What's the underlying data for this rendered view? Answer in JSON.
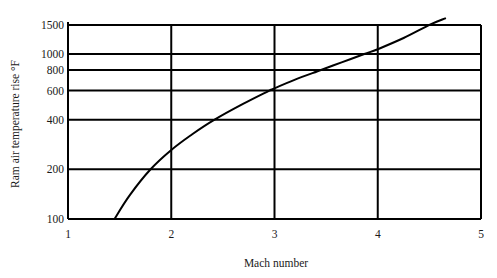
{
  "chart_data": {
    "type": "line",
    "title": "",
    "xlabel": "Mach number",
    "ylabel": "Ram air temperature rise °F",
    "xlim": [
      1,
      5
    ],
    "ylim": [
      100,
      1500
    ],
    "yscale": "log",
    "grid": true,
    "legend": null,
    "x_ticks": [
      "1",
      "2",
      "3",
      "4",
      "5"
    ],
    "y_ticks": [
      "100",
      "200",
      "400",
      "600",
      "800",
      "1000",
      "1500"
    ],
    "series": [
      {
        "name": "Ram air temperature rise",
        "x": [
          1.45,
          1.6,
          1.8,
          2.0,
          2.2,
          2.42,
          2.7,
          2.95,
          3.0,
          3.2,
          3.45,
          3.65,
          3.87,
          4.0,
          4.25,
          4.5,
          4.66
        ],
        "y": [
          100,
          140,
          200,
          262,
          325,
          400,
          500,
          600,
          620,
          700,
          800,
          890,
          1000,
          1070,
          1250,
          1500,
          1650
        ]
      }
    ]
  },
  "plot": {
    "x_pixels": {
      "1": 68,
      "2": 171,
      "3": 276,
      "4": 378,
      "5": 481
    },
    "y_bottom_px": 219,
    "px_per_decade": 165,
    "color": "#000000"
  }
}
